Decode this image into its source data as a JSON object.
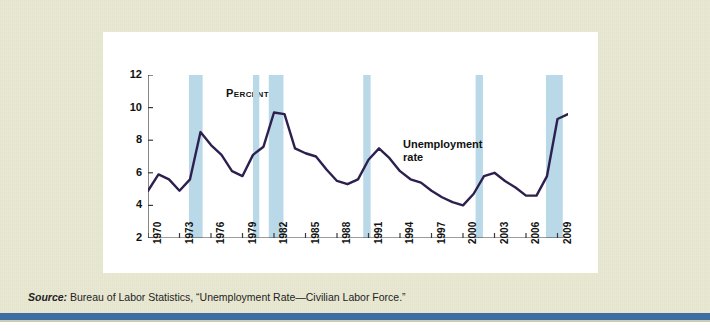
{
  "figure": {
    "panel_background": "#ffffff",
    "page_background": "#e9e9d2",
    "rule_color": "#3f6fa0",
    "annotation": {
      "line1": "Unemployment",
      "line2": "rate"
    },
    "source_prefix": "Source:",
    "source_text": " Bureau of Labor Statistics, “Unemployment Rate—Civilian Labor Force.”"
  },
  "chart_data": {
    "type": "line",
    "title": "",
    "subtitle": "",
    "xlabel": "",
    "ylabel": "Percent",
    "ylim": [
      2,
      12
    ],
    "xlim": [
      1970,
      2010
    ],
    "grid": false,
    "legend": "none",
    "line_color": "#2d1f4e",
    "band_color": "#b9d9e8",
    "ytick_labels": [
      "12",
      "10",
      "8",
      "6",
      "4",
      "2"
    ],
    "yticks": [
      12,
      10,
      8,
      6,
      4,
      2
    ],
    "xtick_labels": [
      "1970",
      "1973",
      "1976",
      "1979",
      "1982",
      "1985",
      "1988",
      "1991",
      "1994",
      "1997",
      "2000",
      "2003",
      "2006",
      "2009"
    ],
    "xticks": [
      1970,
      1973,
      1976,
      1979,
      1982,
      1985,
      1988,
      1991,
      1994,
      1997,
      2000,
      2003,
      2006,
      2009
    ],
    "series": [
      {
        "name": "Unemployment rate",
        "x": [
          1970,
          1971,
          1972,
          1973,
          1974,
          1975,
          1976,
          1977,
          1978,
          1979,
          1980,
          1981,
          1982,
          1983,
          1984,
          1985,
          1986,
          1987,
          1988,
          1989,
          1990,
          1991,
          1992,
          1993,
          1994,
          1995,
          1996,
          1997,
          1998,
          1999,
          2000,
          2001,
          2002,
          2003,
          2004,
          2005,
          2006,
          2007,
          2008,
          2009,
          2010
        ],
        "values": [
          4.9,
          5.9,
          5.6,
          4.9,
          5.6,
          8.5,
          7.7,
          7.1,
          6.1,
          5.8,
          7.1,
          7.6,
          9.7,
          9.6,
          7.5,
          7.2,
          7.0,
          6.2,
          5.5,
          5.3,
          5.6,
          6.8,
          7.5,
          6.9,
          6.1,
          5.6,
          5.4,
          4.9,
          4.5,
          4.2,
          4.0,
          4.7,
          5.8,
          6.0,
          5.5,
          5.1,
          4.6,
          4.6,
          5.8,
          9.3,
          9.6
        ]
      }
    ],
    "recession_bands": [
      {
        "start": 1973.9,
        "end": 1975.2
      },
      {
        "start": 1980.0,
        "end": 1980.6
      },
      {
        "start": 1981.5,
        "end": 1982.9
      },
      {
        "start": 1990.5,
        "end": 1991.2
      },
      {
        "start": 2001.2,
        "end": 2001.9
      },
      {
        "start": 2007.9,
        "end": 2009.5
      }
    ]
  }
}
